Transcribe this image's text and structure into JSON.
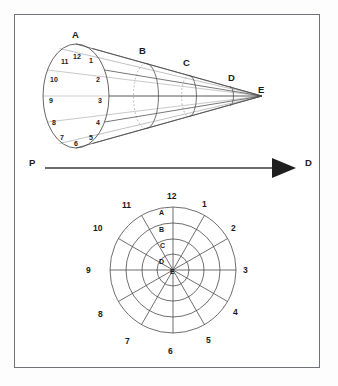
{
  "figure": {
    "background_color": "#ffffff",
    "frame_color": "#6f7377",
    "stroke_color": "#444444",
    "text_color": "#1a1a1a"
  },
  "cone_diagram": {
    "name": "perspective-cone",
    "cross_section_labels": [
      "A",
      "B",
      "C",
      "D",
      "E"
    ],
    "apex_label": "E",
    "base_label": "A",
    "clock_numbers": [
      "12",
      "1",
      "2",
      "3",
      "4",
      "5",
      "6",
      "7",
      "8",
      "9",
      "10",
      "11"
    ],
    "base_ellipse": {
      "cx": 76,
      "cy": 96,
      "rx": 33,
      "ry": 52
    },
    "apex": {
      "x": 262,
      "y": 96
    },
    "sections": [
      {
        "label": "A",
        "x": 76,
        "rx": 33,
        "ry": 52,
        "label_x": 72,
        "label_y": 30
      },
      {
        "label": "B",
        "x": 146,
        "rx": 12.5,
        "ry": 32.5,
        "label_x": 139,
        "label_y": 46
      },
      {
        "label": "C",
        "x": 189,
        "rx": 7.5,
        "ry": 20.5,
        "label_x": 183,
        "label_y": 58
      },
      {
        "label": "D",
        "x": 230,
        "rx": 3.5,
        "ry": 9.5,
        "label_x": 228,
        "label_y": 73
      },
      {
        "label": "E",
        "x": 262,
        "rx": 0,
        "ry": 0,
        "label_x": 258,
        "label_y": 85
      }
    ]
  },
  "arrow": {
    "name": "direction-arrow",
    "start_label": "P",
    "end_label": "D",
    "start_label_pos": {
      "x": 29,
      "y": 158
    },
    "end_label_pos": {
      "x": 305,
      "y": 158
    },
    "line": {
      "x1": 45,
      "y1": 168,
      "x2": 272,
      "y2": 168
    },
    "head": {
      "x": 292,
      "y": 168,
      "size": 11
    }
  },
  "polar_chart": {
    "name": "polar-clock-chart",
    "center": {
      "x": 173,
      "y": 270
    },
    "outer_radius": 63,
    "ring_count": 4,
    "spoke_count": 12,
    "outer_numbers": [
      "12",
      "1",
      "2",
      "3",
      "4",
      "5",
      "6",
      "7",
      "8",
      "9",
      "10",
      "11"
    ],
    "ring_labels": [
      "A",
      "B",
      "C",
      "D",
      "E"
    ],
    "ring_label_positions": [
      {
        "label": "A",
        "x": 159,
        "y": 209,
        "radius": 63
      },
      {
        "label": "B",
        "x": 159,
        "y": 226,
        "radius": 47
      },
      {
        "label": "C",
        "x": 160,
        "y": 242,
        "radius": 31
      },
      {
        "label": "D",
        "x": 159,
        "y": 258,
        "radius": 16
      },
      {
        "label": "E",
        "x": 170,
        "y": 268,
        "radius": 0
      }
    ],
    "outer_number_positions": [
      {
        "label": "12",
        "x": 167,
        "y": 192
      },
      {
        "label": "1",
        "x": 202,
        "y": 200
      },
      {
        "label": "2",
        "x": 231,
        "y": 224
      },
      {
        "label": "3",
        "x": 243,
        "y": 266
      },
      {
        "label": "4",
        "x": 233,
        "y": 308
      },
      {
        "label": "5",
        "x": 206,
        "y": 336
      },
      {
        "label": "6",
        "x": 168,
        "y": 347
      },
      {
        "label": "7",
        "x": 125,
        "y": 337
      },
      {
        "label": "8",
        "x": 98,
        "y": 310
      },
      {
        "label": "9",
        "x": 86,
        "y": 266
      },
      {
        "label": "10",
        "x": 93,
        "y": 224
      },
      {
        "label": "11",
        "x": 122,
        "y": 201
      }
    ]
  }
}
